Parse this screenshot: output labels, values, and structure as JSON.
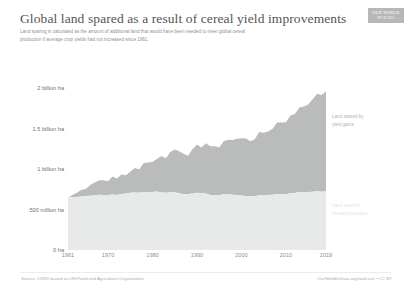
{
  "header": {
    "title": "Global land spared as a result of cereal yield improvements",
    "subtitle_line1": "Land sparing is calculated as the amount of additional land that would have been needed to meet global cereal",
    "subtitle_line2": "production if average crop yields had not increased since 1961.",
    "logo_line1": "OUR WORLD",
    "logo_line2": "IN DATA"
  },
  "footer": {
    "source": "Source: OWID based on UN Food and Agriculture Organization",
    "link": "OurWorldInData.org/land-use • CC BY"
  },
  "annotations": {
    "spared_line1": "Land spared by",
    "spared_line2": "yield gains",
    "used_line1": "Land used for",
    "used_line2": "cereal production"
  },
  "chart_data": {
    "type": "area",
    "title": "Global land spared as a result of cereal yield improvements",
    "xlabel": "",
    "ylabel": "",
    "xlim": [
      1961,
      2019
    ],
    "ylim": [
      0,
      2400000000
    ],
    "grid": false,
    "stacked": true,
    "legend_position": "inline-right",
    "y_tick_labels": [
      "0 ha",
      "500 million ha",
      "1 billion ha",
      "1.5 billion ha",
      "2 billion ha"
    ],
    "y_tick_values": [
      0,
      500000000,
      1000000000,
      1500000000,
      2000000000
    ],
    "x_tick_labels": [
      "1961",
      "1970",
      "1980",
      "1990",
      "2000",
      "2010",
      "2019"
    ],
    "x_tick_values": [
      1961,
      1970,
      1980,
      1990,
      2000,
      2010,
      2019
    ],
    "colors": {
      "land_used": "#e8eae9",
      "land_spared": "#b9bcba",
      "axis_text": "#8e9195",
      "title_text": "#555555"
    },
    "x": [
      1961,
      1962,
      1963,
      1964,
      1965,
      1966,
      1967,
      1968,
      1969,
      1970,
      1971,
      1972,
      1973,
      1974,
      1975,
      1976,
      1977,
      1978,
      1979,
      1980,
      1981,
      1982,
      1983,
      1984,
      1985,
      1986,
      1987,
      1988,
      1989,
      1990,
      1991,
      1992,
      1993,
      1994,
      1995,
      1996,
      1997,
      1998,
      1999,
      2000,
      2001,
      2002,
      2003,
      2004,
      2005,
      2006,
      2007,
      2008,
      2009,
      2010,
      2011,
      2012,
      2013,
      2014,
      2015,
      2016,
      2017,
      2018,
      2019
    ],
    "series": [
      {
        "name": "Land used for cereal production",
        "label_line1": "Land used for",
        "label_line2": "cereal production",
        "color": "#e8eae9",
        "unit": "hectares",
        "values": [
          648000000,
          655000000,
          657000000,
          662000000,
          668000000,
          670000000,
          676000000,
          682000000,
          681000000,
          679000000,
          686000000,
          681000000,
          694000000,
          700000000,
          707000000,
          711000000,
          708000000,
          713000000,
          711000000,
          717000000,
          723000000,
          712000000,
          709000000,
          713000000,
          715000000,
          703000000,
          690000000,
          693000000,
          700000000,
          708000000,
          702000000,
          698000000,
          681000000,
          676000000,
          678000000,
          692000000,
          693000000,
          685000000,
          678000000,
          674000000,
          669000000,
          664000000,
          666000000,
          677000000,
          675000000,
          679000000,
          685000000,
          693000000,
          692000000,
          690000000,
          702000000,
          706000000,
          716000000,
          714000000,
          717000000,
          722000000,
          726000000,
          722000000,
          728000000
        ]
      },
      {
        "name": "Land spared by yield gains",
        "label_line1": "Land spared by",
        "label_line2": "yield gains",
        "color": "#b9bcba",
        "unit": "hectares",
        "values": [
          0,
          26000000,
          50000000,
          84000000,
          86000000,
          134000000,
          160000000,
          182000000,
          182000000,
          170000000,
          223000000,
          202000000,
          239000000,
          226000000,
          262000000,
          304000000,
          291000000,
          361000000,
          371000000,
          372000000,
          404000000,
          452000000,
          427000000,
          499000000,
          527000000,
          520000000,
          501000000,
          472000000,
          550000000,
          596000000,
          566000000,
          622000000,
          602000000,
          606000000,
          589000000,
          652000000,
          670000000,
          676000000,
          698000000,
          710000000,
          711000000,
          680000000,
          705000000,
          784000000,
          775000000,
          786000000,
          816000000,
          884000000,
          886000000,
          889000000,
          961000000,
          978000000,
          1046000000,
          1062000000,
          1082000000,
          1144000000,
          1206000000,
          1196000000,
          1235000000
        ]
      }
    ]
  }
}
